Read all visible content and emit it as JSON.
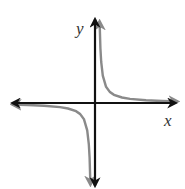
{
  "chart_data": {
    "type": "line",
    "title": "",
    "xlabel": "x",
    "ylabel": "y",
    "function": "y = 1/x",
    "grid": false,
    "legend": null,
    "series": [
      {
        "name": "branch-quadrant-I",
        "color": "#8a8a8a",
        "x": [
          0.1,
          0.15,
          0.2,
          0.3,
          0.5,
          0.75,
          1,
          1.5,
          2,
          3,
          4,
          5
        ],
        "y": [
          10,
          6.67,
          5,
          3.33,
          2,
          1.33,
          1,
          0.67,
          0.5,
          0.33,
          0.25,
          0.2
        ]
      },
      {
        "name": "branch-quadrant-III",
        "color": "#8a8a8a",
        "x": [
          -5,
          -4,
          -3,
          -2,
          -1.5,
          -1,
          -0.75,
          -0.5,
          -0.3,
          -0.2,
          -0.15,
          -0.1
        ],
        "y": [
          -0.2,
          -0.25,
          -0.33,
          -0.5,
          -0.67,
          -1,
          -1.33,
          -2,
          -3.33,
          -5,
          -6.67,
          -10
        ]
      }
    ],
    "axes_color": "#111111",
    "xlim": [
      -5.5,
      5.5
    ],
    "ylim": [
      -5.5,
      5.5
    ]
  }
}
